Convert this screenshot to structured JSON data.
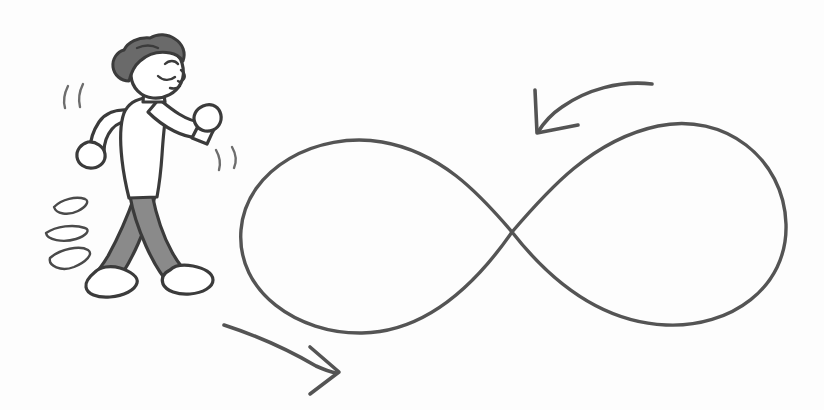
{
  "scene": {
    "title": "Person walking an infinite loop",
    "alt_text": "Hand-drawn line illustration of a person walking to the right, with a large infinity symbol beside them and two curved directional arrows indicating continuous motion",
    "background_color": "#fdfdfd",
    "canvas": {
      "width": 824,
      "height": 410
    },
    "style": "hand-drawn marker sketch",
    "ink_color": "#4a4a4a",
    "outline_color": "#3b3b3b",
    "stroke_color": "#545454"
  },
  "figure": {
    "label": "walking person",
    "facing": "right",
    "hair": {
      "label": "curly hair",
      "color": "#6a6a6a"
    },
    "face": {
      "label": "profile face",
      "expression": "eyes closed, content",
      "eyebrow": "raised arc",
      "eye": "closed curve",
      "nose": "small profile nose"
    },
    "shirt": {
      "label": "short sleeve shirt",
      "color": "#ffffff"
    },
    "pants": {
      "label": "trousers",
      "color": "#8a8a8a"
    },
    "shoes": {
      "label": "sneakers",
      "color": "#ffffff"
    },
    "back_arm": {
      "label": "back arm swinging down and behind"
    },
    "front_arm": {
      "label": "front arm bent with raised fist"
    },
    "back_leg": {
      "label": "back leg extended behind"
    },
    "front_leg": {
      "label": "front leg stepping forward"
    }
  },
  "effects": {
    "motion_lines_back": {
      "label": "motion lines behind head",
      "count": 2
    },
    "motion_lines_front": {
      "label": "motion lines near front fist",
      "count": 2
    },
    "speed_marks": {
      "label": "speed marks at ground level",
      "count": 3
    }
  },
  "infinity": {
    "label": "infinity symbol",
    "meaning": "endless loop",
    "crossing_point": {
      "x": 512,
      "y": 232
    },
    "left_loop": {
      "center_x": 375,
      "top_y": 141,
      "bottom_y": 333,
      "outer_x": 240
    },
    "right_loop": {
      "center_x": 655,
      "top_y": 124,
      "bottom_y": 325,
      "outer_x": 786
    }
  },
  "arrows": [
    {
      "name": "top-arrow",
      "label": "upper arrow pointing left and down",
      "direction": "left-down",
      "tip": {
        "x": 540,
        "y": 131
      },
      "tail": {
        "x": 652,
        "y": 84
      }
    },
    {
      "name": "bottom-arrow",
      "label": "lower arrow pointing right and down",
      "direction": "right-down",
      "tip": {
        "x": 337,
        "y": 372
      },
      "tail": {
        "x": 224,
        "y": 325
      }
    }
  ]
}
